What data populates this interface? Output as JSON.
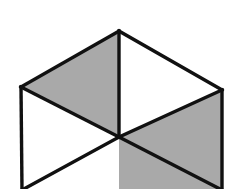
{
  "figure": {
    "title": "Isometric cube line drawing with two shaded faces",
    "type": "geometric-line-drawing",
    "canvas": {
      "width": 238,
      "height": 189,
      "background": "#ffffff"
    },
    "colors": {
      "background": "#ffffff",
      "shaded_face": "#a9a9a9",
      "plain_face": "#ffffff",
      "edge_stroke": "#111111"
    },
    "stroke_width": 3.4,
    "vertices": {
      "top_apex": {
        "x": 119,
        "y": 31
      },
      "left_corner": {
        "x": 21,
        "y": 87
      },
      "right_corner": {
        "x": 222,
        "y": 90
      },
      "center": {
        "x": 119,
        "y": 137
      },
      "left_bottom": {
        "x": 22,
        "y": 190
      },
      "right_bottom": {
        "x": 222,
        "y": 190
      },
      "center_bottom": {
        "x": 119,
        "y": 190
      }
    },
    "faces": [
      {
        "name": "top-left-face",
        "shading": "shaded",
        "fill": "#a9a9a9",
        "points": "21,87 119,31 119,137"
      },
      {
        "name": "top-right-face",
        "shading": "plain",
        "fill": "#ffffff",
        "points": "119,31 222,90 119,137"
      },
      {
        "name": "lower-right-face",
        "shading": "shaded",
        "fill": "#a9a9a9",
        "points": "119,137 222,90 222,190 119,190"
      },
      {
        "name": "lower-left-face",
        "shading": "plain",
        "fill": "#ffffff",
        "points": "21,87 119,137 119,190 22,190"
      }
    ],
    "edges": [
      {
        "name": "edge-left-to-apex",
        "d": "M21,87 L119,31"
      },
      {
        "name": "edge-apex-to-right",
        "d": "M119,31 L222,90"
      },
      {
        "name": "edge-left-to-center",
        "d": "M21,87 L119,137"
      },
      {
        "name": "edge-center-to-right",
        "d": "M119,137 L222,90"
      },
      {
        "name": "edge-apex-to-center-vertical",
        "d": "M119,31 L119,137"
      },
      {
        "name": "edge-left-vertical",
        "d": "M21,87 L22,190"
      },
      {
        "name": "edge-right-vertical",
        "d": "M222,90 L222,190"
      },
      {
        "name": "edge-center-down-left",
        "d": "M119,137 L22,190"
      },
      {
        "name": "edge-center-down-right",
        "d": "M119,137 L222,190"
      }
    ],
    "notes": {
      "cropped": "bottom of figure is cut off by the image edge",
      "shaded_count": 2,
      "plain_count": 2
    }
  }
}
